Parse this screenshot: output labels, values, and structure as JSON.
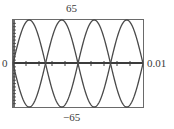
{
  "chart_data": {
    "type": "line",
    "title": "",
    "xlabel": "",
    "ylabel": "",
    "xlim": [
      0,
      0.01
    ],
    "ylim": [
      -65,
      65
    ],
    "window_labels": {
      "ymax": "65",
      "ymin": "−65",
      "xmin": "0",
      "xmax": "0.01"
    },
    "x_tick_step": 0.001,
    "y_tick_step": 5,
    "grid": false,
    "series": [
      {
        "name": "y1 = 65 sin(400πt)",
        "amplitude": 65,
        "frequency_hz": 200,
        "phase": 0
      },
      {
        "name": "y2 = -65 sin(400πt)",
        "amplitude": -65,
        "frequency_hz": 200,
        "phase": 0
      }
    ],
    "zero_crossings": [
      0,
      0.0025,
      0.005,
      0.0075,
      0.01
    ]
  },
  "colors": {
    "curve": "#4a4a4a",
    "axis": "#3c3c3c",
    "frame": "#6a6a6a"
  }
}
